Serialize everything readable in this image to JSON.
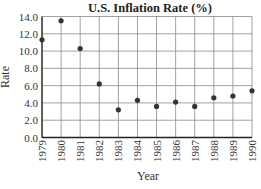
{
  "chart_data": {
    "type": "scatter",
    "title": "U.S. Inflation Rate (%)",
    "xlabel": "Year",
    "ylabel": "Rate",
    "categories": [
      "1979",
      "1980",
      "1981",
      "1982",
      "1983",
      "1984",
      "1985",
      "1986",
      "1987",
      "1988",
      "1989",
      "1990"
    ],
    "values": [
      11.3,
      13.5,
      10.3,
      6.2,
      3.2,
      4.3,
      3.6,
      4.1,
      3.6,
      4.6,
      4.8,
      5.4
    ],
    "ylim": [
      0,
      14
    ],
    "yticks": [
      "0.0",
      "2.0",
      "4.0",
      "6.0",
      "8.0",
      "10.0",
      "12.0",
      "14.0"
    ],
    "grid": true,
    "legend": null,
    "colors": {
      "point": "#333333",
      "grid": "#8a8a8a",
      "axis": "#222222"
    }
  }
}
